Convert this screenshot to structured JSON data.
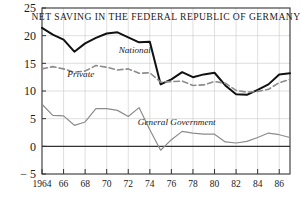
{
  "chart_data": {
    "type": "line",
    "title": "NET SAVING IN THE FEDERAL REPUBLIC OF GERMANY",
    "xlabel": "",
    "ylabel": "",
    "ylim": [
      -5,
      25
    ],
    "xlim": [
      1964,
      1987
    ],
    "grid": true,
    "legend_position": "inline-annotations",
    "yticks": [
      -5,
      0,
      5,
      10,
      15,
      20,
      25
    ],
    "ytick_labels": [
      "− 5",
      "0",
      "5",
      "10",
      "15",
      "20",
      "25"
    ],
    "xticks": [
      1964,
      1966,
      1968,
      1970,
      1972,
      1974,
      1976,
      1978,
      1980,
      1982,
      1984,
      1986
    ],
    "xtick_labels": [
      "1964",
      "66",
      "68",
      "70",
      "72",
      "74",
      "76",
      "78",
      "80",
      "82",
      "84",
      "86"
    ],
    "x": [
      1964,
      1965,
      1966,
      1967,
      1968,
      1969,
      1970,
      1971,
      1972,
      1973,
      1974,
      1975,
      1976,
      1977,
      1978,
      1979,
      1980,
      1981,
      1982,
      1983,
      1984,
      1985,
      1986,
      1987
    ],
    "series": [
      {
        "name": "National",
        "style": "solid",
        "color": "#111111",
        "label_x": 1972.6,
        "label_y": 16.9,
        "values": [
          21.4,
          20.2,
          19.3,
          17.1,
          18.6,
          19.6,
          20.4,
          20.6,
          19.7,
          18.8,
          18.9,
          11.2,
          12.1,
          13.4,
          12.5,
          13.0,
          13.3,
          11.0,
          9.4,
          9.3,
          10.2,
          11.2,
          13.0,
          13.2
        ]
      },
      {
        "name": "Private",
        "style": "dashed",
        "color": "#8c8c8c",
        "label_x": 1967.6,
        "label_y": 12.5,
        "values": [
          14.0,
          14.4,
          14.0,
          13.4,
          13.6,
          14.6,
          14.3,
          13.8,
          14.0,
          13.2,
          13.3,
          11.6,
          11.7,
          11.8,
          11.0,
          11.1,
          11.7,
          11.4,
          10.1,
          9.8,
          9.9,
          10.3,
          11.5,
          12.1
        ]
      },
      {
        "name": "General Government",
        "style": "solid-thin",
        "color": "#8c8c8c",
        "label_x": 1976.5,
        "label_y": 3.9,
        "values": [
          7.6,
          5.6,
          5.5,
          3.8,
          4.4,
          6.8,
          6.8,
          6.5,
          5.4,
          7.0,
          3.0,
          -0.7,
          1.2,
          2.7,
          2.4,
          2.2,
          2.2,
          0.8,
          0.6,
          0.9,
          1.6,
          2.4,
          2.1,
          1.6
        ]
      }
    ]
  },
  "axes": {
    "y_axis_name": "net-saving-percent",
    "x_axis_name": "year"
  }
}
